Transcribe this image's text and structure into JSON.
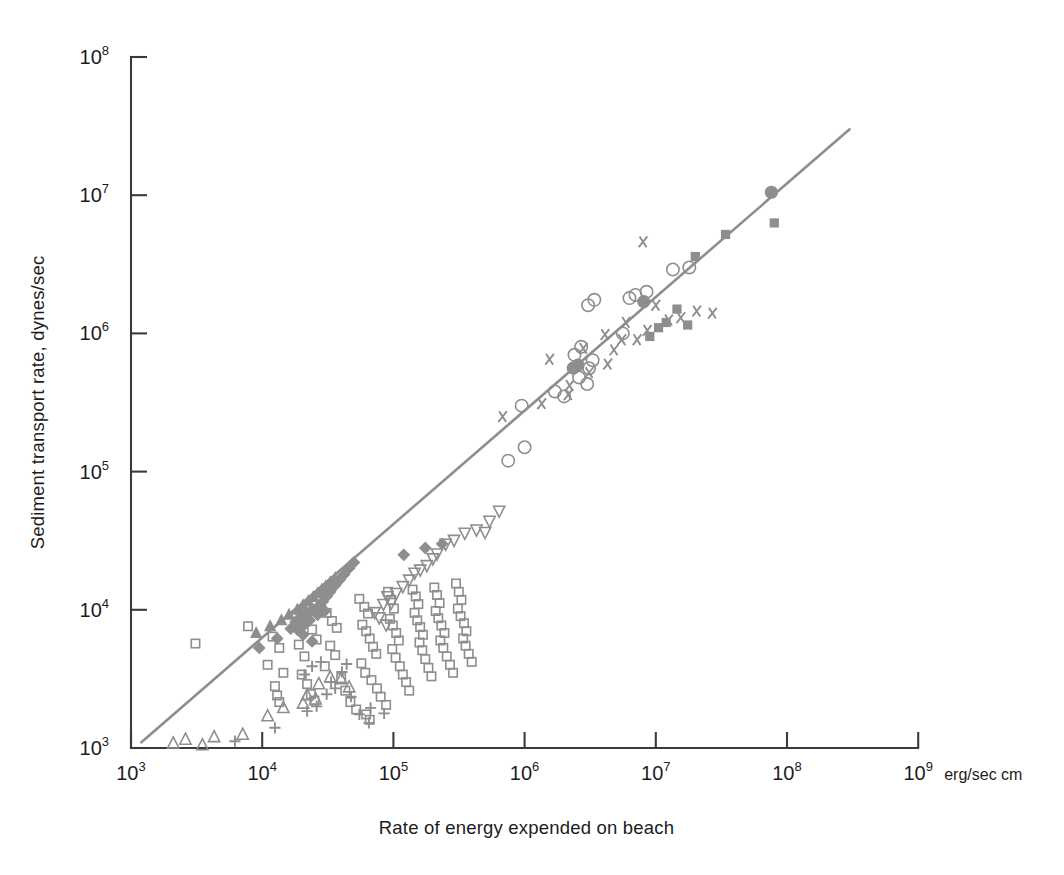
{
  "figure": {
    "background_color": "#ffffff",
    "marker_color": "#8e8e8e",
    "axis_color": "#3a3a3a",
    "trend_line_color": "#8e8e8e"
  },
  "axes": {
    "x_title": "Rate of energy expended on beach",
    "y_title": "Sediment transport rate, dynes/sec",
    "x_unit": "erg/sec cm",
    "x_tick_labels": [
      "10",
      "10",
      "10",
      "10",
      "10",
      "10",
      "10"
    ],
    "x_tick_exponents": [
      "3",
      "4",
      "5",
      "6",
      "7",
      "8",
      "9"
    ],
    "y_tick_labels": [
      "10",
      "10",
      "10",
      "10",
      "10",
      "10"
    ],
    "y_tick_exponents": [
      "8",
      "7",
      "6",
      "5",
      "4",
      "3"
    ]
  },
  "chart_data": {
    "type": "scatter",
    "title": "",
    "xlabel": "Rate of energy expended on beach",
    "ylabel": "Sediment transport rate, dynes/sec",
    "xunit": "erg/sec cm",
    "xscale": "log",
    "yscale": "log",
    "xlim": [
      1000,
      1000000000
    ],
    "ylim": [
      1000,
      100000000
    ],
    "xticks": [
      1000,
      10000,
      100000,
      1000000,
      10000000,
      100000000,
      1000000000
    ],
    "yticks": [
      1000,
      10000,
      100000,
      1000000,
      10000000,
      100000000
    ],
    "grid": false,
    "legend": "none",
    "annotations": [],
    "trend_line": {
      "label": "fitted regression line",
      "x_start": 1200,
      "y_start": 1100,
      "x_end": 300000000,
      "y_end": 30000000
    },
    "series": [
      {
        "name": "open-square",
        "marker": "open-square",
        "points": [
          [
            3100,
            5700
          ],
          [
            7800,
            7600
          ],
          [
            12000,
            6400
          ],
          [
            13500,
            5300
          ],
          [
            11000,
            4000
          ],
          [
            14500,
            3500
          ],
          [
            12500,
            2800
          ],
          [
            13000,
            2400
          ],
          [
            13500,
            2150
          ],
          [
            19000,
            5600
          ],
          [
            21000,
            4600
          ],
          [
            24000,
            7200
          ],
          [
            26000,
            6100
          ],
          [
            20000,
            3400
          ],
          [
            22000,
            2900
          ],
          [
            23500,
            2450
          ],
          [
            25000,
            2200
          ],
          [
            31000,
            9500
          ],
          [
            34000,
            8300
          ],
          [
            37000,
            7400
          ],
          [
            33000,
            5500
          ],
          [
            36000,
            4700
          ],
          [
            30000,
            3900
          ],
          [
            40000,
            3200
          ],
          [
            43000,
            2600
          ],
          [
            47000,
            2150
          ],
          [
            52000,
            1900
          ],
          [
            55000,
            12000
          ],
          [
            60000,
            10500
          ],
          [
            64000,
            9400
          ],
          [
            58000,
            7800
          ],
          [
            62000,
            7000
          ],
          [
            66000,
            6200
          ],
          [
            70000,
            5400
          ],
          [
            74000,
            4800
          ],
          [
            57000,
            4100
          ],
          [
            61000,
            3500
          ],
          [
            68000,
            3100
          ],
          [
            75000,
            2700
          ],
          [
            80000,
            2350
          ],
          [
            88000,
            2050
          ],
          [
            91000,
            13500
          ],
          [
            96000,
            11800
          ],
          [
            101000,
            10200
          ],
          [
            94000,
            8600
          ],
          [
            99000,
            7700
          ],
          [
            105000,
            6800
          ],
          [
            110000,
            6000
          ],
          [
            98000,
            5200
          ],
          [
            104000,
            4500
          ],
          [
            112000,
            3900
          ],
          [
            118000,
            3400
          ],
          [
            125000,
            3000
          ],
          [
            132000,
            2600
          ],
          [
            140000,
            14000
          ],
          [
            148000,
            12500
          ],
          [
            155000,
            11000
          ],
          [
            145000,
            9500
          ],
          [
            152000,
            8400
          ],
          [
            160000,
            7500
          ],
          [
            168000,
            6600
          ],
          [
            158000,
            5800
          ],
          [
            166000,
            5100
          ],
          [
            175000,
            4400
          ],
          [
            185000,
            3800
          ],
          [
            195000,
            3300
          ],
          [
            205000,
            14500
          ],
          [
            215000,
            12800
          ],
          [
            225000,
            11200
          ],
          [
            210000,
            9800
          ],
          [
            220000,
            8700
          ],
          [
            232000,
            7700
          ],
          [
            245000,
            6800
          ],
          [
            228000,
            6000
          ],
          [
            240000,
            5300
          ],
          [
            255000,
            4600
          ],
          [
            270000,
            4000
          ],
          [
            285000,
            3500
          ],
          [
            300000,
            15500
          ],
          [
            315000,
            13500
          ],
          [
            330000,
            11800
          ],
          [
            310000,
            10200
          ],
          [
            325000,
            9000
          ],
          [
            345000,
            8000
          ],
          [
            360000,
            7000
          ],
          [
            340000,
            6200
          ],
          [
            355000,
            5500
          ],
          [
            375000,
            4800
          ],
          [
            395000,
            4200
          ],
          [
            62000,
            1750
          ],
          [
            66000,
            1600
          ]
        ]
      },
      {
        "name": "filled-diamond",
        "marker": "filled-diamond",
        "points": [
          [
            9500,
            5300
          ],
          [
            13000,
            6200
          ],
          [
            16500,
            7300
          ],
          [
            18000,
            8200
          ],
          [
            20000,
            9000
          ],
          [
            21500,
            9400
          ],
          [
            23000,
            9700
          ],
          [
            24500,
            9900
          ],
          [
            26000,
            10300
          ],
          [
            27500,
            10800
          ],
          [
            29000,
            11500
          ],
          [
            31000,
            12500
          ],
          [
            33000,
            13500
          ],
          [
            36000,
            15000
          ],
          [
            39000,
            16500
          ],
          [
            42000,
            18000
          ],
          [
            46000,
            20000
          ],
          [
            50000,
            22000
          ],
          [
            23000,
            8400
          ],
          [
            26500,
            9200
          ],
          [
            30000,
            9800
          ],
          [
            21000,
            7800
          ],
          [
            18500,
            7200
          ],
          [
            20500,
            6600
          ],
          [
            24000,
            5900
          ],
          [
            120000,
            25000
          ],
          [
            175000,
            28000
          ],
          [
            235000,
            30000
          ]
        ]
      },
      {
        "name": "filled-triangle-up",
        "marker": "filled-triangle-up",
        "points": [
          [
            9000,
            6800
          ],
          [
            11500,
            7600
          ],
          [
            14000,
            8400
          ],
          [
            16000,
            9200
          ],
          [
            18500,
            10000
          ],
          [
            20500,
            10800
          ],
          [
            22500,
            11600
          ],
          [
            24500,
            12400
          ],
          [
            26500,
            13200
          ],
          [
            28500,
            14000
          ],
          [
            30500,
            14800
          ],
          [
            33000,
            15800
          ],
          [
            36000,
            17000
          ]
        ]
      },
      {
        "name": "open-triangle-up",
        "marker": "open-triangle-up",
        "points": [
          [
            2100,
            1080
          ],
          [
            2600,
            1150
          ],
          [
            4300,
            1200
          ],
          [
            7100,
            1250
          ],
          [
            3500,
            1050
          ],
          [
            14500,
            1950
          ],
          [
            20500,
            2100
          ],
          [
            27000,
            2900
          ],
          [
            33000,
            3250
          ],
          [
            40000,
            3150
          ],
          [
            46000,
            2750
          ],
          [
            22000,
            2400
          ],
          [
            25500,
            2250
          ],
          [
            11000,
            1700
          ]
        ]
      },
      {
        "name": "plus",
        "marker": "plus",
        "points": [
          [
            6200,
            1120
          ],
          [
            12500,
            1400
          ],
          [
            22000,
            1850
          ],
          [
            26000,
            2000
          ],
          [
            31000,
            2450
          ],
          [
            36000,
            2700
          ],
          [
            40500,
            3550
          ],
          [
            44000,
            4050
          ],
          [
            47500,
            2350
          ],
          [
            55000,
            1750
          ],
          [
            65000,
            1520
          ],
          [
            21000,
            3400
          ],
          [
            24000,
            3900
          ],
          [
            28000,
            4200
          ],
          [
            33500,
            3000
          ],
          [
            67000,
            1950
          ],
          [
            85000,
            1780
          ]
        ]
      },
      {
        "name": "open-triangle-down",
        "marker": "open-triangle-down",
        "points": [
          [
            72000,
            9600
          ],
          [
            78000,
            8800
          ],
          [
            84000,
            11000
          ],
          [
            90000,
            12500
          ],
          [
            96000,
            11200
          ],
          [
            105000,
            13200
          ],
          [
            118000,
            14800
          ],
          [
            132000,
            16500
          ],
          [
            145000,
            18500
          ],
          [
            160000,
            19500
          ],
          [
            180000,
            21000
          ],
          [
            200000,
            23500
          ],
          [
            215000,
            25500
          ],
          [
            250000,
            30000
          ],
          [
            290000,
            32000
          ],
          [
            350000,
            36000
          ],
          [
            430000,
            38000
          ],
          [
            500000,
            36500
          ],
          [
            540000,
            44000
          ],
          [
            640000,
            52000
          ],
          [
            88000,
            7800
          ]
        ]
      },
      {
        "name": "open-circle",
        "marker": "open-circle",
        "points": [
          [
            750000,
            120000
          ],
          [
            1000000,
            150000
          ],
          [
            950000,
            300000
          ],
          [
            1700000,
            380000
          ],
          [
            2000000,
            350000
          ],
          [
            2600000,
            480000
          ],
          [
            3000000,
            430000
          ],
          [
            3100000,
            560000
          ],
          [
            3300000,
            640000
          ],
          [
            3050000,
            1600000
          ],
          [
            3400000,
            1750000
          ],
          [
            6300000,
            1800000
          ],
          [
            7000000,
            1900000
          ],
          [
            5600000,
            1000000
          ],
          [
            8500000,
            2000000
          ],
          [
            13500000,
            2900000
          ],
          [
            18000000,
            3000000
          ],
          [
            2400000,
            700000
          ],
          [
            2700000,
            800000
          ]
        ]
      },
      {
        "name": "filled-circle",
        "marker": "filled-circle",
        "points": [
          [
            2550000,
            590000
          ],
          [
            8100000,
            1700000
          ],
          [
            76000000,
            10500000
          ],
          [
            2350000,
            560000
          ]
        ]
      },
      {
        "name": "filled-square",
        "marker": "filled-square",
        "points": [
          [
            10500000,
            1100000
          ],
          [
            12000000,
            1200000
          ],
          [
            14500000,
            1500000
          ],
          [
            20000000,
            3600000
          ],
          [
            34000000,
            5200000
          ],
          [
            80000000,
            6300000
          ],
          [
            17500000,
            1150000
          ],
          [
            9000000,
            950000
          ]
        ]
      },
      {
        "name": "x-cross",
        "marker": "x-cross",
        "points": [
          [
            680000,
            250000
          ],
          [
            1350000,
            310000
          ],
          [
            1550000,
            650000
          ],
          [
            2200000,
            420000
          ],
          [
            2800000,
            780000
          ],
          [
            3100000,
            520000
          ],
          [
            4300000,
            600000
          ],
          [
            4800000,
            760000
          ],
          [
            4100000,
            980000
          ],
          [
            5500000,
            900000
          ],
          [
            5900000,
            1200000
          ],
          [
            7200000,
            900000
          ],
          [
            8600000,
            1050000
          ],
          [
            10000000,
            1600000
          ],
          [
            12500000,
            1250000
          ],
          [
            15500000,
            1300000
          ],
          [
            20500000,
            1450000
          ],
          [
            27000000,
            1400000
          ],
          [
            8000000,
            4600000
          ],
          [
            2150000,
            360000
          ]
        ]
      }
    ]
  }
}
